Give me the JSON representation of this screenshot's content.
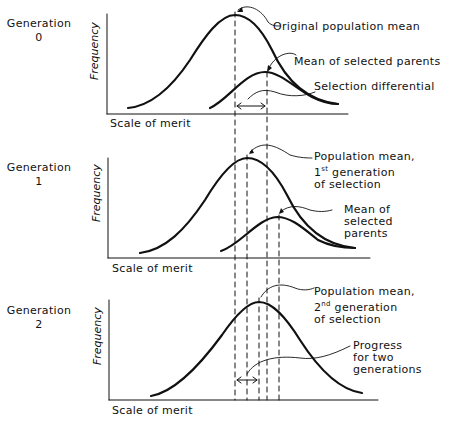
{
  "diagram": {
    "panels": [
      {
        "generation_label": "Generation",
        "generation_number": "0",
        "y_axis_label": "Frequency",
        "x_axis_label": "Scale of merit",
        "annotations": {
          "mean": "Original population mean",
          "selected": "Mean of selected parents",
          "differential": "Selection differential"
        }
      },
      {
        "generation_label": "Generation",
        "generation_number": "1",
        "y_axis_label": "Frequency",
        "x_axis_label": "Scale of merit",
        "annotations": {
          "mean_line1": "Population mean,",
          "mean_line2_num": "1",
          "mean_line2_sup": "st",
          "mean_line2_rest": " generation",
          "mean_line3": "of selection",
          "selected_line1": "Mean of",
          "selected_line2": "selected",
          "selected_line3": "parents"
        }
      },
      {
        "generation_label": "Generation",
        "generation_number": "2",
        "y_axis_label": "Frequency",
        "x_axis_label": "Scale of merit",
        "annotations": {
          "mean_line1": "Population mean,",
          "mean_line2_num": "2",
          "mean_line2_sup": "nd",
          "mean_line2_rest": " generation",
          "mean_line3": "of selection",
          "progress_line1": "Progress",
          "progress_line2": "for two",
          "progress_line3": "generations"
        }
      }
    ],
    "colors": {
      "ink": "#111111",
      "background": "#ffffff"
    }
  }
}
